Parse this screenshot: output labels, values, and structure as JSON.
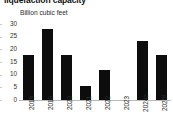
{
  "chart_data": {
    "type": "bar",
    "title": "liquefaction capacity",
    "subtitle": "Billion cubic feet",
    "xlabel": "",
    "ylabel": "Billion cubic feet",
    "categories": [
      "2018",
      "2019",
      "2020",
      "2021",
      "2022",
      "2023",
      "2024e",
      "2025f"
    ],
    "values": [
      17.6,
      28.2,
      17.9,
      5.7,
      11.9,
      0,
      23.4,
      17.8
    ],
    "ylim": [
      0,
      30
    ],
    "yticks": [
      0,
      5,
      10,
      15,
      20,
      25,
      30
    ],
    "ytick_labels": [
      "0",
      "5",
      "10",
      "15",
      "20",
      "25",
      "30"
    ],
    "grid": false,
    "legend": "none",
    "bar_color": "#0d0d0d",
    "background_color": "#ffffff",
    "axis_color": "#b9b9b9"
  }
}
